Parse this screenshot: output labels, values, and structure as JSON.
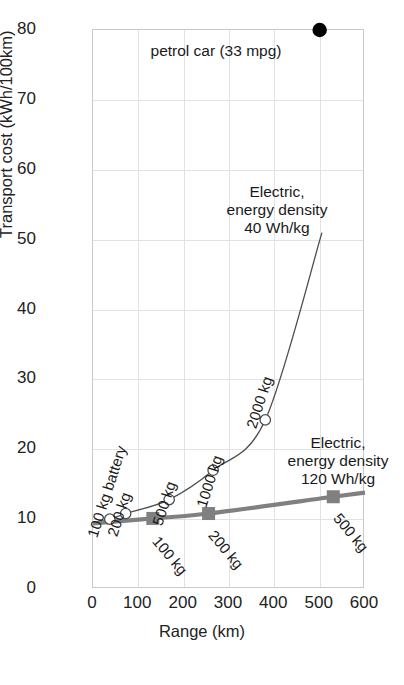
{
  "chart_data": {
    "type": "line",
    "title": "",
    "xlabel": "Range (km)",
    "ylabel": "Transport cost (kWh/100km)",
    "xlim": [
      0,
      600
    ],
    "ylim": [
      0,
      80
    ],
    "xticks": [
      0,
      100,
      200,
      300,
      400,
      500,
      600
    ],
    "yticks": [
      0,
      10,
      20,
      30,
      40,
      50,
      60,
      70,
      80
    ],
    "grid": true,
    "legend_position": "inline-annotations",
    "series": [
      {
        "name": "petrol car (33 mpg)",
        "type": "scatter",
        "marker": "filled-circle",
        "color": "#000000",
        "points": [
          {
            "x": 500,
            "y": 80,
            "label": "petrol car (33 mpg)"
          }
        ]
      },
      {
        "name": "Electric, energy density 40 Wh/kg",
        "type": "line",
        "marker": "open-circle",
        "color": "#4d4d4d",
        "points": [
          {
            "x": 37,
            "y": 10.0,
            "label": "100 kg battery"
          },
          {
            "x": 72,
            "y": 10.8,
            "label": "200 kg"
          },
          {
            "x": 168,
            "y": 12.8,
            "label": "500 kg"
          },
          {
            "x": 265,
            "y": 17.0,
            "label": "1000 kg"
          },
          {
            "x": 380,
            "y": 24.2,
            "label": "2000 kg"
          },
          {
            "x": 505,
            "y": 51.0,
            "label": ""
          }
        ]
      },
      {
        "name": "Electric, energy density 120 Wh/kg",
        "type": "line",
        "marker": "filled-square",
        "color": "#808080",
        "points": [
          {
            "x": 0,
            "y": 9.4,
            "label": ""
          },
          {
            "x": 132,
            "y": 10.1,
            "label": "100 kg"
          },
          {
            "x": 255,
            "y": 10.8,
            "label": "200 kg"
          },
          {
            "x": 530,
            "y": 13.2,
            "label": "500 kg"
          },
          {
            "x": 600,
            "y": 13.8,
            "label": ""
          }
        ]
      }
    ],
    "annotations": [
      {
        "id": "petrol",
        "text": "petrol car (33 mpg)"
      },
      {
        "id": "electric40",
        "text": "Electric,\nenergy density\n40 Wh/kg"
      },
      {
        "id": "electric120",
        "text": "Electric,\nenergy density\n120 Wh/kg"
      }
    ]
  },
  "axes": {
    "y": {
      "label": "Transport cost (kWh/100km)",
      "ticks": [
        "0",
        "10",
        "20",
        "30",
        "40",
        "50",
        "60",
        "70",
        "80"
      ]
    },
    "x": {
      "label": "Range (km)",
      "ticks": [
        "0",
        "100",
        "200",
        "300",
        "400",
        "500",
        "600"
      ]
    }
  },
  "annotations": {
    "petrol_car": "petrol car (33 mpg)",
    "electric_40_line1": "Electric,",
    "electric_40_line2": "energy density",
    "electric_40_line3": "40 Wh/kg",
    "electric_120_line1": "Electric,",
    "electric_120_line2": "energy density",
    "electric_120_line3": "120 Wh/kg"
  },
  "point_labels": {
    "c100": "100 kg battery",
    "c200": "200 kg",
    "c500": "500 kg",
    "c1000": "1000 kg",
    "c2000": "2000 kg",
    "s100": "100 kg",
    "s200": "200 kg",
    "s500": "500 kg"
  },
  "colors": {
    "thin_curve": "#4d4d4d",
    "thick_curve": "#808080",
    "petrol_dot": "#000000",
    "grid": "#e2e2e2",
    "frame": "#c9c9c9",
    "text": "#1a1a1a"
  }
}
